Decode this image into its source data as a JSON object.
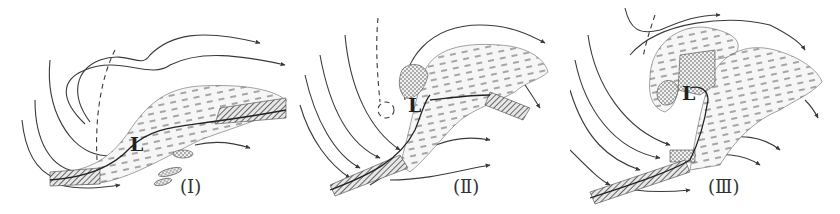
{
  "diagram": {
    "panels": [
      {
        "id": "I",
        "label": "(Ⅰ)",
        "low_marker": "L"
      },
      {
        "id": "II",
        "label": "(Ⅱ)",
        "low_marker": "L"
      },
      {
        "id": "III",
        "label": "(Ⅲ)",
        "low_marker": "L"
      }
    ],
    "colors": {
      "line": "#3a3a3a",
      "cloud_fill": "#f3f3f3",
      "hatch": "#555555",
      "background": "#ffffff"
    }
  }
}
